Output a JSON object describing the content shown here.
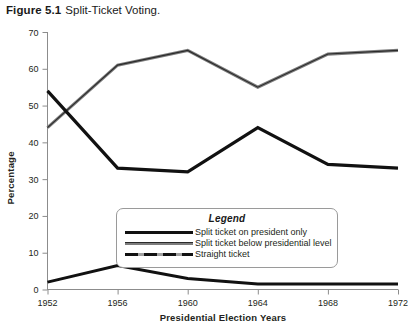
{
  "figure": {
    "label": "Figure 5.1",
    "title": "Split-Ticket Voting."
  },
  "legend": {
    "title": "Legend",
    "entries": [
      {
        "label": "Split ticket on president only",
        "style": "thick-black"
      },
      {
        "label": "Split ticket below presidential level",
        "style": "gray"
      },
      {
        "label": "Straight ticket",
        "style": "dashed"
      }
    ]
  },
  "chart_data": {
    "type": "line",
    "title": "Split-Ticket Voting.",
    "xlabel": "Presidential Election Years",
    "ylabel": "Percentage",
    "categories": [
      "1952",
      "1956",
      "1960",
      "1964",
      "1968",
      "1972"
    ],
    "x": [
      1952,
      1956,
      1960,
      1964,
      1968,
      1972
    ],
    "xlim": [
      1952,
      1972
    ],
    "ylim": [
      0,
      70
    ],
    "yticks": [
      0,
      10,
      20,
      30,
      40,
      50,
      60,
      70
    ],
    "grid": false,
    "legend_position": "inside-bottom-center",
    "series": [
      {
        "name": "Split ticket on president only",
        "values": [
          54,
          33,
          32,
          44,
          34,
          33
        ]
      },
      {
        "name": "Split ticket below presidential level",
        "values": [
          44,
          61,
          65,
          55,
          64,
          65
        ]
      },
      {
        "name": "Straight ticket",
        "values": [
          2,
          6.5,
          3,
          1.5,
          1.5,
          1.5
        ]
      }
    ]
  }
}
